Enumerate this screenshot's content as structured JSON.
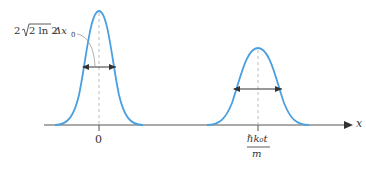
{
  "diagram": {
    "width_label": "2√(2 ln 2) Δx₀",
    "width_label_parts": {
      "prefix": "2",
      "radicand": "2 ln 2",
      "suffix": "Δx",
      "subscript": "0"
    },
    "axis_label": "x",
    "tick_0_label": "0",
    "tick_1_label_numerator": "ℏk₀t",
    "tick_1_label_denominator": "m",
    "curve_color": "#4a9fe0",
    "axis_color": "#555555",
    "dashed_color": "#bbbbbb",
    "packets": [
      {
        "center_x": 99,
        "peak_y": 11,
        "base_left": 55,
        "base_right": 145,
        "arrow_y": 67,
        "arrow_left": 82,
        "arrow_right": 117
      },
      {
        "center_x": 258,
        "peak_y": 48,
        "base_left": 207,
        "base_right": 309,
        "arrow_y": 89,
        "arrow_left": 233,
        "arrow_right": 283
      }
    ]
  }
}
